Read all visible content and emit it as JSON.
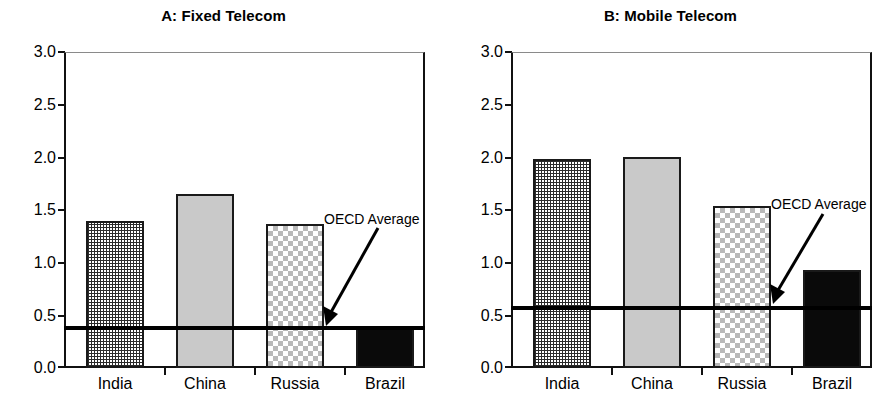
{
  "chart_data": [
    {
      "type": "bar",
      "panel": "A",
      "title": "A: Fixed Telecom",
      "categories": [
        "India",
        "China",
        "Russia",
        "Brazil"
      ],
      "values": [
        1.4,
        1.65,
        1.37,
        0.38
      ],
      "xlabel": "",
      "ylabel": "",
      "ylim": [
        0.0,
        3.0
      ],
      "ytick_labels": [
        "0.0",
        "0.5",
        "1.0",
        "1.5",
        "2.0",
        "2.5",
        "3.0"
      ],
      "ytick_values": [
        0.0,
        0.5,
        1.0,
        1.5,
        2.0,
        2.5,
        3.0
      ],
      "grid": false,
      "legend": "none",
      "annotations": [
        {
          "text": "OECD Average",
          "type": "reference-line-label",
          "value": 0.38
        }
      ],
      "reference_line": {
        "label": "OECD Average",
        "value": 0.38
      },
      "bar_fills": [
        "fine-grid",
        "light-gray",
        "checkerboard",
        "solid-black"
      ]
    },
    {
      "type": "bar",
      "panel": "B",
      "title": "B: Mobile Telecom",
      "categories": [
        "India",
        "China",
        "Russia",
        "Brazil"
      ],
      "values": [
        1.98,
        2.0,
        1.54,
        0.93
      ],
      "xlabel": "",
      "ylabel": "",
      "ylim": [
        0.0,
        3.0
      ],
      "ytick_labels": [
        "0.0",
        "0.5",
        "1.0",
        "1.5",
        "2.0",
        "2.5",
        "3.0"
      ],
      "ytick_values": [
        0.0,
        0.5,
        1.0,
        1.5,
        2.0,
        2.5,
        3.0
      ],
      "grid": false,
      "legend": "none",
      "annotations": [
        {
          "text": "OECD Average",
          "type": "reference-line-label",
          "value": 0.57
        }
      ],
      "reference_line": {
        "label": "OECD Average",
        "value": 0.57
      },
      "bar_fills": [
        "fine-grid",
        "light-gray",
        "checkerboard",
        "solid-black"
      ]
    }
  ],
  "panels": [
    {
      "title": "A: Fixed Telecom",
      "ytick_labels": [
        "3.0",
        "2.5",
        "2.0",
        "1.5",
        "1.0",
        "0.5",
        "0.0"
      ],
      "categories": [
        "India",
        "China",
        "Russia",
        "Brazil"
      ],
      "avg_label": "OECD Average"
    },
    {
      "title": "B: Mobile Telecom",
      "ytick_labels": [
        "3.0",
        "2.5",
        "2.0",
        "1.5",
        "1.0",
        "0.5",
        "0.0"
      ],
      "categories": [
        "India",
        "China",
        "Russia",
        "Brazil"
      ],
      "avg_label": "OECD Average"
    }
  ],
  "colors": {
    "axis": "#111111",
    "reference_line": "#000000",
    "bar_gray": "#c9c9c9",
    "bar_black": "#0a0a0a",
    "background": "#ffffff"
  }
}
